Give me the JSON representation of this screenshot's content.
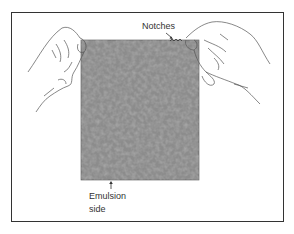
{
  "figure": {
    "labels": {
      "notches": "Notches",
      "emulsion_line1": "Emulsion",
      "emulsion_line2": "side"
    },
    "colors": {
      "film": "#8c8c8c",
      "line": "#444444",
      "frame": "#333333"
    }
  }
}
